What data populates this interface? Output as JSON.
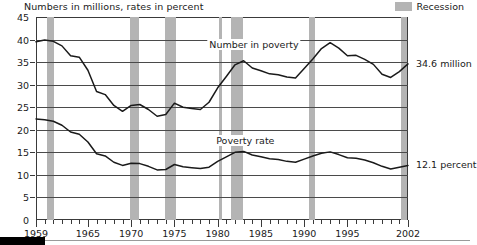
{
  "chart_data": {
    "type": "line",
    "title": "Numbers in millions, rates in percent",
    "xlabel": "",
    "ylabel": "",
    "ylim": [
      0,
      45
    ],
    "xlim": [
      1959,
      2002
    ],
    "ytick_labels": [
      "45",
      "40",
      "35",
      "30",
      "25",
      "20",
      "15",
      "10",
      "5",
      "0"
    ],
    "ytick_values": [
      45,
      40,
      35,
      30,
      25,
      20,
      15,
      10,
      5,
      0
    ],
    "xtick_labels": [
      "1959",
      "1965",
      "1970",
      "1975",
      "1980",
      "1985",
      "1990",
      "1995",
      "2002"
    ],
    "xtick_values": [
      1959,
      1965,
      1970,
      1975,
      1980,
      1985,
      1990,
      1995,
      2002
    ],
    "grid": true,
    "legend": [
      {
        "label": "Recession",
        "color": "#b4b4b4"
      }
    ],
    "legend_position": "top-right",
    "x": [
      1959,
      1960,
      1961,
      1962,
      1963,
      1964,
      1965,
      1966,
      1967,
      1968,
      1969,
      1970,
      1971,
      1972,
      1973,
      1974,
      1975,
      1976,
      1977,
      1978,
      1979,
      1980,
      1981,
      1982,
      1983,
      1984,
      1985,
      1986,
      1987,
      1988,
      1989,
      1990,
      1991,
      1992,
      1993,
      1994,
      1995,
      1996,
      1997,
      1998,
      1999,
      2000,
      2001,
      2002
    ],
    "series": [
      {
        "name": "Number in poverty",
        "unit": "millions",
        "end_label": "34.6 million",
        "values": [
          39.5,
          39.9,
          39.6,
          38.6,
          36.4,
          36.1,
          33.2,
          28.5,
          27.8,
          25.4,
          24.1,
          25.4,
          25.6,
          24.5,
          23.0,
          23.4,
          25.9,
          25.0,
          24.7,
          24.5,
          26.1,
          29.3,
          31.8,
          34.4,
          35.3,
          33.7,
          33.1,
          32.4,
          32.2,
          31.7,
          31.5,
          33.6,
          35.7,
          38.0,
          39.3,
          38.1,
          36.4,
          36.5,
          35.6,
          34.5,
          32.3,
          31.6,
          32.9,
          34.6
        ]
      },
      {
        "name": "Poverty rate",
        "unit": "percent",
        "end_label": "12.1 percent",
        "values": [
          22.4,
          22.2,
          21.9,
          21.0,
          19.5,
          19.0,
          17.3,
          14.7,
          14.2,
          12.8,
          12.1,
          12.6,
          12.5,
          11.9,
          11.1,
          11.2,
          12.3,
          11.8,
          11.6,
          11.4,
          11.7,
          13.0,
          14.0,
          15.0,
          15.2,
          14.4,
          14.0,
          13.6,
          13.4,
          13.0,
          12.8,
          13.5,
          14.2,
          14.8,
          15.1,
          14.5,
          13.8,
          13.7,
          13.3,
          12.7,
          11.9,
          11.3,
          11.7,
          12.1
        ]
      }
    ],
    "recessions": [
      {
        "start": 1960.3,
        "end": 1961.1
      },
      {
        "start": 1969.9,
        "end": 1970.9
      },
      {
        "start": 1973.9,
        "end": 1975.2
      },
      {
        "start": 1980.1,
        "end": 1980.5
      },
      {
        "start": 1981.5,
        "end": 1982.9
      },
      {
        "start": 1990.5,
        "end": 1991.2
      },
      {
        "start": 2001.2,
        "end": 2001.9
      }
    ],
    "annotations": [
      {
        "text": "Number in poverty",
        "x": 1984.2,
        "y": 38.6
      },
      {
        "text": "Poverty rate",
        "x": 1983.2,
        "y": 17.2
      }
    ]
  }
}
